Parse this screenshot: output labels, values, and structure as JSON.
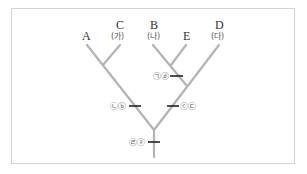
{
  "diagram": {
    "type": "cladogram",
    "taxa": [
      {
        "id": "A",
        "label": "A",
        "sublabel": ""
      },
      {
        "id": "C",
        "label": "C",
        "sublabel": "(가)"
      },
      {
        "id": "B",
        "label": "B",
        "sublabel": "(나)"
      },
      {
        "id": "E",
        "label": "E",
        "sublabel": ""
      },
      {
        "id": "D",
        "label": "D",
        "sublabel": "(다)"
      }
    ],
    "branch_marks": [
      {
        "id": "top",
        "text": "㉠ⓓ"
      },
      {
        "id": "left",
        "text": "㉡ⓑ"
      },
      {
        "id": "right",
        "text": "ⓒ㉢"
      },
      {
        "id": "root",
        "text": "㉣ⓐ"
      }
    ],
    "colors": {
      "branch": "#b3b3b3",
      "tick": "#222222",
      "frame": "#d4d4d4"
    }
  }
}
